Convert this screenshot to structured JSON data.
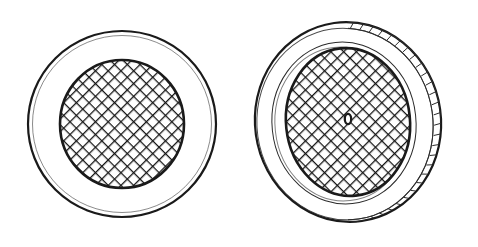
{
  "document": {
    "title": "Mesh-screened circular cap — two views",
    "kind": "technical-line-drawing",
    "background_color": "#ffffff",
    "ink_color": "#1a1a1a",
    "canvas": {
      "width": 478,
      "height": 247
    }
  },
  "figures": [
    {
      "id": "figure-left",
      "label": "plan-view",
      "view": "top plan view",
      "center": {
        "x": 122,
        "y": 124
      },
      "outer_rim": {
        "name": "outer-rim-circle",
        "rx": 94,
        "ry": 93,
        "stroke_width": 2.2,
        "fill": "#ffffff"
      },
      "inner_ledge": {
        "name": "inner-ledge-circle",
        "rx": 89,
        "ry": 88,
        "stroke_width": 1,
        "fill": "none"
      },
      "screen": {
        "name": "mesh-screen-disc",
        "rx": 62,
        "ry": 64,
        "stroke_width": 2.4,
        "fill": "#ffffff",
        "mesh": {
          "pattern": "diagonal-crosshatch",
          "angle_degrees": 45,
          "pitch_px": 9,
          "stroke_width": 1.5
        }
      },
      "center_aperture": null
    },
    {
      "id": "figure-right",
      "label": "perspective-view",
      "view": "tilted three-quarter view",
      "center": {
        "x": 348,
        "y": 122
      },
      "outer_rim": {
        "name": "outer-rim-ellipse",
        "rx": 93,
        "ry": 100,
        "rotation_degrees": -8,
        "stroke_width": 2.2,
        "fill": "#ffffff"
      },
      "rim_back_edge": {
        "name": "rim-back-edge-arc",
        "rx": 89,
        "ry": 96,
        "rotation_degrees": -8,
        "stroke_width": 1.4
      },
      "inner_ledge": {
        "name": "inner-ledge-ellipse",
        "rx": 71,
        "ry": 80,
        "rotation_degrees": -6,
        "stroke_width": 1.6
      },
      "knurl_band": {
        "name": "knurled-rim-band",
        "description": "ribbed gripping band along the visible right flank of the rim",
        "rib_count": 26,
        "stroke_width": 1.2,
        "arc_start_degrees": -78,
        "arc_end_degrees": 82
      },
      "screen": {
        "name": "mesh-screen-disc",
        "rx": 62,
        "ry": 74,
        "rotation_degrees": -6,
        "stroke_width": 2.4,
        "fill": "#ffffff",
        "mesh": {
          "pattern": "diagonal-crosshatch",
          "angle_degrees": 45,
          "pitch_px": 9,
          "stroke_width": 1.5
        }
      },
      "center_aperture": {
        "name": "center-aperture-hole",
        "shape": "oval",
        "cx": 348,
        "cy": 119,
        "rx": 3.2,
        "ry": 5.2,
        "stroke_width": 2.2,
        "fill": "#ffffff"
      }
    }
  ]
}
